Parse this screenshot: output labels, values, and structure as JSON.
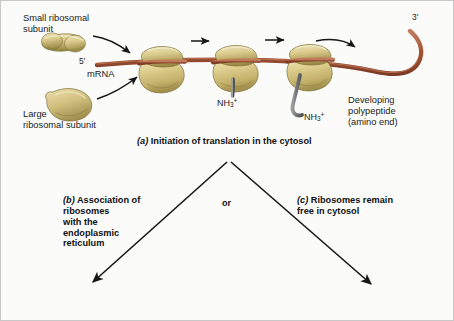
{
  "figure": {
    "title_caption_a": "Initiation of translation in the cytosol",
    "tag_a": "(a)",
    "tag_b": "(b)",
    "tag_c": "(c)",
    "caption_b_lines": "Association of\nribosomes\nwith the\nendoplasmic\nreticulum",
    "caption_c_lines": "Ribosomes remain\nfree in cytosol",
    "or_label": "or"
  },
  "labels": {
    "small_subunit": "Small ribosomal\nsubunit",
    "large_subunit": "Large\nribosomal subunit",
    "five_prime": "5′",
    "mrna": "mRNA",
    "three_prime": "3′",
    "developing_polypeptide": "Developing\npolypeptide\n(amino end)",
    "nh3_1": "NH",
    "nh3_1_sub": "3",
    "nh3_1_sup": "+",
    "nh3_2": "NH",
    "nh3_2_sub": "3",
    "nh3_2_sup": "+"
  },
  "colors": {
    "background": "#fbfbfa",
    "border": "#c8c8c8",
    "ribosome_light": "#e3d9a4",
    "ribosome_mid": "#cbbd78",
    "ribosome_dark": "#a89а55",
    "ribosome_shadow": "#8f8243",
    "mrna_strand": "#a8543a",
    "mrna_highlight": "#c4775a",
    "polypeptide_gray": "#77787a",
    "arrow_black": "#161616",
    "text": "#1b1b1b"
  },
  "diagram": {
    "ribosome_count": 3,
    "small_subunit_count": 1,
    "large_subunit_count": 1,
    "branch_arrow_count": 2,
    "transit_arrow_count": 3,
    "recruit_arrow_count": 2
  }
}
